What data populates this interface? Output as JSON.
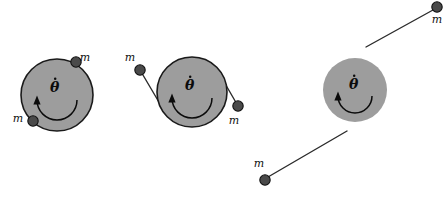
{
  "figure": {
    "type": "physics-diagram",
    "title": "",
    "caption": "",
    "background_color": "#ffffff",
    "disk_fill_color": "#9d9d9d",
    "disk_stroke_color": "#1a1a1a",
    "mass_fill_color": "#4a4a4a",
    "mass_stroke_color": "#111111",
    "string_color": "#2b2b2b",
    "arrow_color": "#0b0b0b",
    "angular_velocity_symbol": "θ",
    "mass_symbol": "m",
    "panels": [
      {
        "name": "panel-wound",
        "description": "Disk with two masses resting on the rim, strings fully wound",
        "disk": {
          "cx": 57,
          "cy": 95,
          "r": 36,
          "outlined": true
        },
        "theta_label": {
          "x": 50,
          "y": 92
        },
        "arrow": {
          "cx": 57,
          "cy": 100,
          "r": 20
        },
        "masses": [
          {
            "id": "mass-top-right",
            "cx": 76,
            "cy": 62,
            "r": 5.2,
            "label": "m",
            "label_x": 85,
            "label_y": 61,
            "string": null
          },
          {
            "id": "mass-bottom-left",
            "cx": 33,
            "cy": 121,
            "r": 5.2,
            "label": "m",
            "label_x": 18,
            "label_y": 122,
            "string": null
          }
        ]
      },
      {
        "name": "panel-partly-unwound",
        "description": "Disk with two masses part-way unwound on short tangent strings",
        "disk": {
          "cx": 192,
          "cy": 92,
          "r": 35,
          "outlined": true
        },
        "theta_label": {
          "x": 185,
          "y": 90
        },
        "arrow": {
          "cx": 192,
          "cy": 98,
          "r": 20
        },
        "masses": [
          {
            "id": "mass-left",
            "cx": 140,
            "cy": 70,
            "r": 5.2,
            "label": "m",
            "label_x": 130,
            "label_y": 61,
            "string": {
              "x1": 140,
              "y1": 70,
              "x2": 166,
              "y2": 114
            }
          },
          {
            "id": "mass-right",
            "cx": 238,
            "cy": 106,
            "r": 5.2,
            "label": "m",
            "label_x": 234,
            "label_y": 124,
            "string": {
              "x1": 238,
              "y1": 106,
              "x2": 216,
              "y2": 68
            }
          }
        ]
      },
      {
        "name": "panel-fully-unwound",
        "description": "Disk with two masses fully unwound on long straight strings, no contact",
        "disk": {
          "cx": 355,
          "cy": 90,
          "r": 32,
          "outlined": false
        },
        "theta_label": {
          "x": 349,
          "y": 89
        },
        "arrow": {
          "cx": 355,
          "cy": 96,
          "r": 17
        },
        "masses": [
          {
            "id": "mass-upper-right",
            "cx": 437,
            "cy": 7,
            "r": 5.2,
            "label": "m",
            "label_x": 437,
            "label_y": 23,
            "string": {
              "x1": 433,
              "y1": 10,
              "x2": 366,
              "y2": 47
            }
          },
          {
            "id": "mass-lower-left",
            "cx": 265,
            "cy": 180,
            "r": 5.2,
            "label": "m",
            "label_x": 259,
            "label_y": 167,
            "string": {
              "x1": 268,
              "y1": 177,
              "x2": 347,
              "y2": 131
            }
          }
        ]
      }
    ]
  }
}
